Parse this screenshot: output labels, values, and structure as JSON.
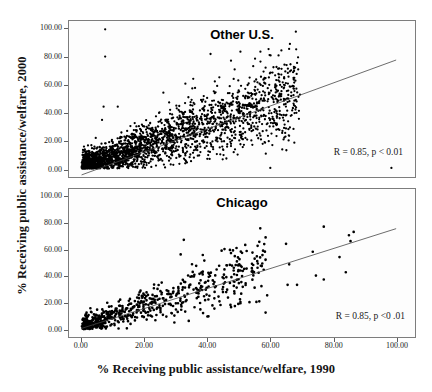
{
  "figure": {
    "width": 432,
    "height": 392,
    "background": "#ffffff",
    "marker_color": "#000000",
    "line_color": "#444444",
    "frame_color": "#7d7d7d"
  },
  "axes": {
    "xlabel": "% Receiving public assistance/welfare, 1990",
    "ylabel": "% Receiving public assistance/welfare, 2000",
    "xticks": [
      "0.00",
      "20.00",
      "40.00",
      "60.00",
      "80.00",
      "100.00"
    ],
    "yticks": [
      "0.00",
      "20.00",
      "40.00",
      "60.00",
      "80.00",
      "100.00"
    ],
    "xlim": [
      -4,
      106
    ],
    "ylim": [
      -6,
      106
    ],
    "grid": false
  },
  "panels": [
    {
      "id": "top",
      "title": "Other U.S.",
      "annotation": "R = 0.85, p < 0.01"
    },
    {
      "id": "bottom",
      "title": "Chicago",
      "annotation": "R = 0.85, p <0 .01"
    }
  ],
  "chart_data": [
    {
      "type": "scatter",
      "title": "Other U.S.",
      "xlabel": "% Receiving public assistance/welfare, 1990",
      "ylabel": "% Receiving public assistance/welfare, 2000",
      "xlim": [
        -4,
        106
      ],
      "ylim": [
        -6,
        106
      ],
      "grid": false,
      "legend": "none",
      "annotation": "R = 0.85, p < 0.01",
      "correlation": 0.85,
      "p_value": "< 0.01",
      "n_points": 2600,
      "density": "very dense cloud hugging the identity-like trend from origin, thinning above x=45",
      "fit_line": {
        "x0": 0,
        "y0": -4.5,
        "x1": 100,
        "y1": 78.0
      },
      "outliers": [
        {
          "x": 7.5,
          "y": 100.0
        },
        {
          "x": 7.5,
          "y": 80.5
        },
        {
          "x": 7.0,
          "y": 44.5
        },
        {
          "x": 11.5,
          "y": 44.5
        },
        {
          "x": 6.5,
          "y": 35.0
        },
        {
          "x": 41.0,
          "y": 82.3
        },
        {
          "x": 50.5,
          "y": 84.0
        },
        {
          "x": 47.5,
          "y": 77.5
        },
        {
          "x": 58.5,
          "y": 72.5
        },
        {
          "x": 61.0,
          "y": 72.8
        },
        {
          "x": 67.5,
          "y": 73.0
        },
        {
          "x": 63.5,
          "y": 67.5
        },
        {
          "x": 55.5,
          "y": 64.0
        },
        {
          "x": 35.5,
          "y": 64.5
        },
        {
          "x": 33.0,
          "y": 61.0
        },
        {
          "x": 61.5,
          "y": 58.5
        },
        {
          "x": 63.5,
          "y": 53.5
        },
        {
          "x": 43.0,
          "y": 10.5
        },
        {
          "x": 60.0,
          "y": 0.5
        },
        {
          "x": 98.5,
          "y": 0.5
        },
        {
          "x": 33.5,
          "y": 4.5
        },
        {
          "x": 26.0,
          "y": 54.5
        }
      ]
    },
    {
      "type": "scatter",
      "title": "Chicago",
      "xlabel": "% Receiving public assistance/welfare, 1990",
      "ylabel": "% Receiving public assistance/welfare, 2000",
      "xlim": [
        -4,
        106
      ],
      "ylim": [
        -6,
        106
      ],
      "grid": false,
      "legend": "none",
      "annotation": "R = 0.85, p <0 .01",
      "correlation": 0.85,
      "p_value": "< 0.01",
      "n_points": 620,
      "density": "dense knot below x=15, loosening linear band to x=60, sparse outliers beyond",
      "fit_line": {
        "x0": 0,
        "y0": 0.5,
        "x1": 100,
        "y1": 76.0
      },
      "outliers": [
        {
          "x": 77.0,
          "y": 77.5
        },
        {
          "x": 86.5,
          "y": 73.5
        },
        {
          "x": 85.0,
          "y": 71.0
        },
        {
          "x": 85.5,
          "y": 66.5
        },
        {
          "x": 32.5,
          "y": 67.5
        },
        {
          "x": 56.5,
          "y": 66.0
        },
        {
          "x": 65.0,
          "y": 64.5
        },
        {
          "x": 73.5,
          "y": 58.5
        },
        {
          "x": 47.5,
          "y": 57.5
        },
        {
          "x": 31.5,
          "y": 56.5
        },
        {
          "x": 57.5,
          "y": 56.0
        },
        {
          "x": 82.0,
          "y": 54.5
        },
        {
          "x": 58.5,
          "y": 52.5
        },
        {
          "x": 66.0,
          "y": 49.0
        },
        {
          "x": 84.0,
          "y": 43.0
        },
        {
          "x": 77.0,
          "y": 37.5
        },
        {
          "x": 74.5,
          "y": 40.5
        },
        {
          "x": 65.5,
          "y": 33.5
        },
        {
          "x": 68.5,
          "y": 33.5
        },
        {
          "x": 59.0,
          "y": 25.5
        },
        {
          "x": 56.5,
          "y": 21.0
        },
        {
          "x": 50.5,
          "y": 20.5
        },
        {
          "x": 58.5,
          "y": 12.5
        },
        {
          "x": 40.0,
          "y": 9.5
        },
        {
          "x": 29.5,
          "y": 5.0
        }
      ]
    }
  ]
}
